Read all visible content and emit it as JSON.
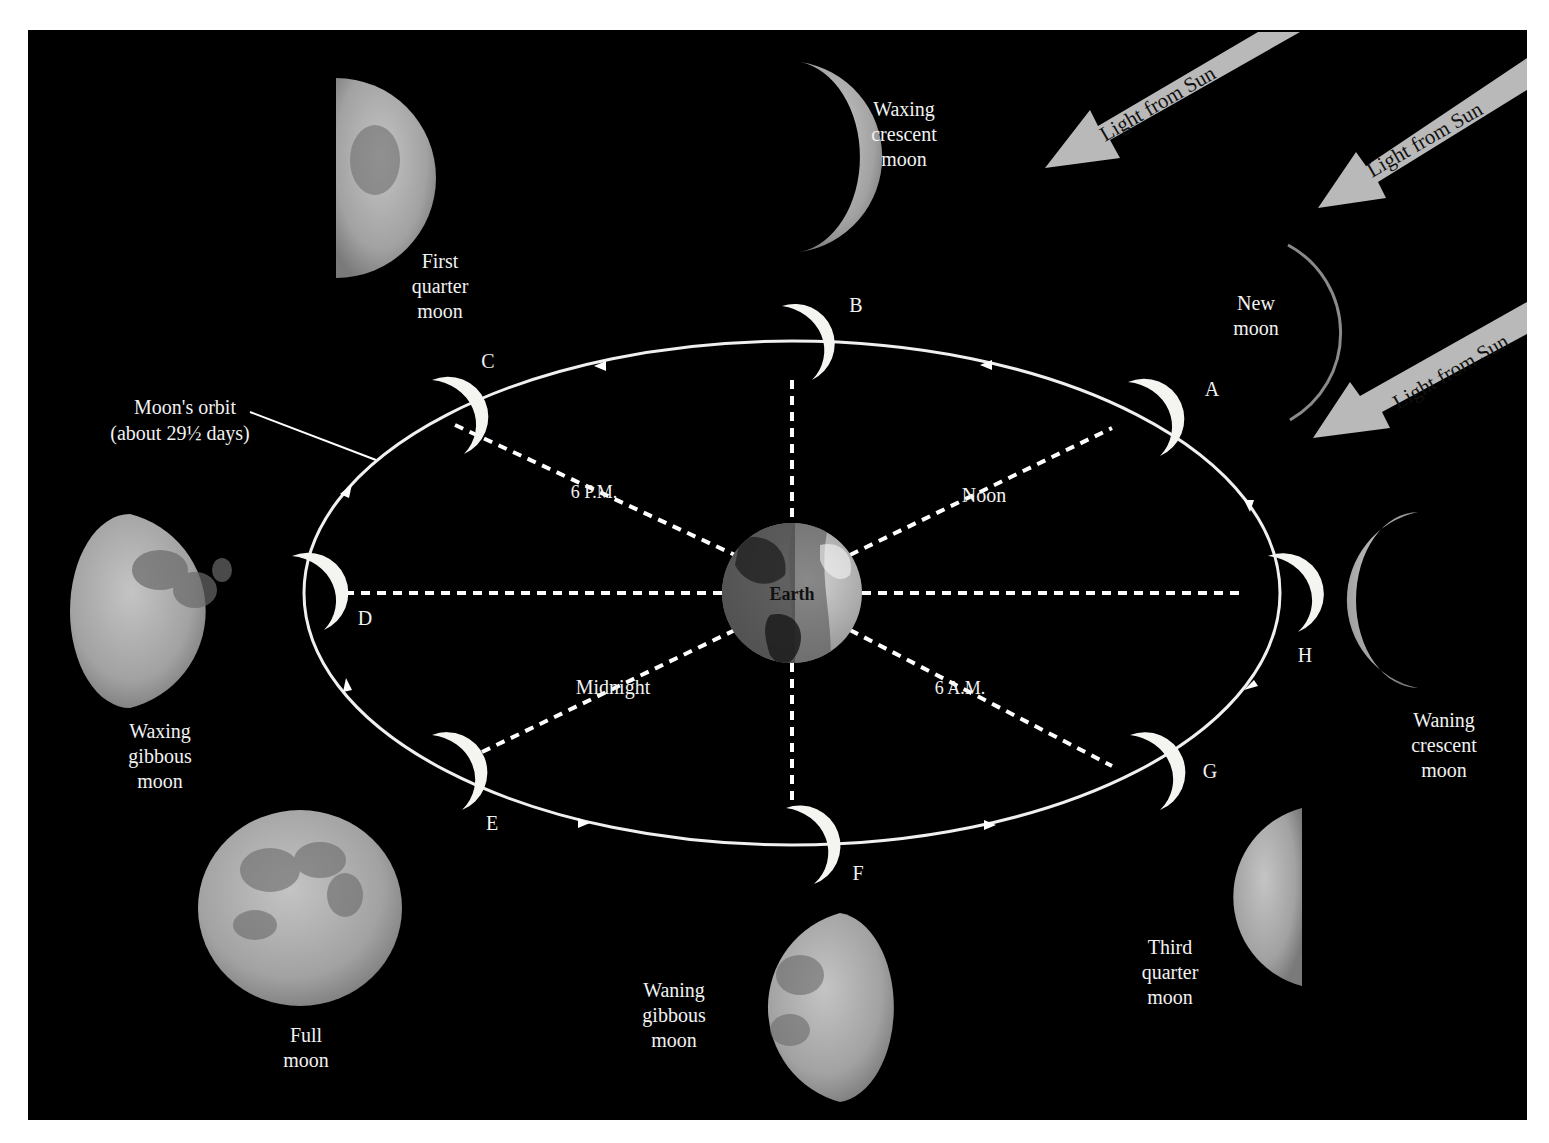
{
  "diagram": {
    "background_color": "#000000",
    "frame_color": "#ffffff",
    "center": {
      "label": "Earth"
    },
    "orbit": {
      "label_line1": "Moon's orbit",
      "label_line2": "(about 29½ days)",
      "direction": "counterclockwise"
    },
    "sunlight_arrows": [
      {
        "label": "Light from Sun"
      },
      {
        "label": "Light from Sun"
      },
      {
        "label": "Light from Sun"
      }
    ],
    "time_labels": {
      "noon": "Noon",
      "six_pm": "6 P.M.",
      "midnight": "Midnight",
      "six_am": "6 A.M."
    },
    "orbit_positions": [
      {
        "letter": "A"
      },
      {
        "letter": "B"
      },
      {
        "letter": "C"
      },
      {
        "letter": "D"
      },
      {
        "letter": "E"
      },
      {
        "letter": "F"
      },
      {
        "letter": "G"
      },
      {
        "letter": "H"
      }
    ],
    "phases": {
      "new": {
        "line1": "New",
        "line2": "moon"
      },
      "waxing_crescent": {
        "line1": "Waxing",
        "line2": "crescent",
        "line3": "moon"
      },
      "first_quarter": {
        "line1": "First",
        "line2": "quarter",
        "line3": "moon"
      },
      "waxing_gibbous": {
        "line1": "Waxing",
        "line2": "gibbous",
        "line3": "moon"
      },
      "full": {
        "line1": "Full",
        "line2": "moon"
      },
      "waning_gibbous": {
        "line1": "Waning",
        "line2": "gibbous",
        "line3": "moon"
      },
      "third_quarter": {
        "line1": "Third",
        "line2": "quarter",
        "line3": "moon"
      },
      "waning_crescent": {
        "line1": "Waning",
        "line2": "crescent",
        "line3": "moon"
      }
    },
    "colors": {
      "arrow": "#b9b9b9",
      "moon_lit": "#f4f4f0",
      "moon_photo": "#a9a9a9",
      "moon_maria": "#6e6e6e",
      "earth_light": "#bdbdbd",
      "earth_dark": "#3a3a3a"
    }
  }
}
